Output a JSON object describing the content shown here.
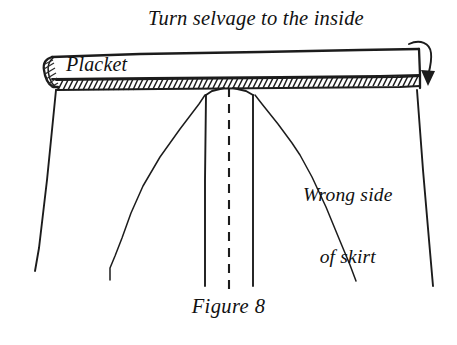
{
  "figure": {
    "caption": "Figure 8",
    "background_color": "#ffffff",
    "ink_color": "#1c1c1c"
  },
  "annotations": {
    "turn_selvage": "Turn selvage to the inside",
    "placket": "Placket",
    "wrong_side_line1": "Wrong side",
    "wrong_side_line2": "of skirt"
  },
  "parts": {
    "waistband": "waistband-band",
    "selvage_edge": "hatched-selvage-edge",
    "placket_strip": "center-placket-strip",
    "fold_line": "dashed-center-fold-line",
    "skirt_body": "skirt-body-outline",
    "turn_arrow": "curved-turn-arrow"
  }
}
